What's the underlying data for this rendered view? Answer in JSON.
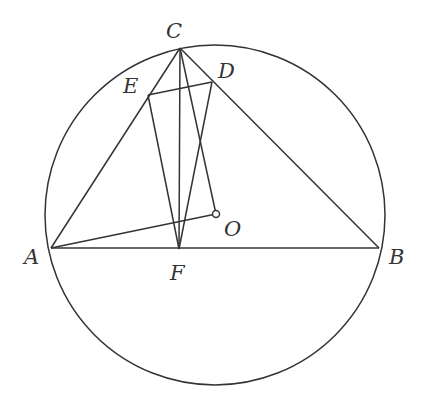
{
  "diagram": {
    "type": "geometry",
    "circle": {
      "center": "O",
      "cx": 215,
      "cy": 215,
      "r": 170
    },
    "points": [
      {
        "name": "A",
        "x": 51,
        "y": 248,
        "label_x": 24,
        "label_y": 264
      },
      {
        "name": "B",
        "x": 379,
        "y": 248,
        "label_x": 389,
        "label_y": 264
      },
      {
        "name": "C",
        "x": 180,
        "y": 48,
        "label_x": 166,
        "label_y": 38
      },
      {
        "name": "D",
        "x": 212,
        "y": 82,
        "label_x": 218,
        "label_y": 78
      },
      {
        "name": "E",
        "x": 148,
        "y": 95,
        "label_x": 123,
        "label_y": 93
      },
      {
        "name": "F",
        "x": 179,
        "y": 249,
        "label_x": 170,
        "label_y": 280
      },
      {
        "name": "O",
        "x": 216,
        "y": 214,
        "label_x": 224,
        "label_y": 236
      }
    ],
    "segments": [
      [
        "A",
        "B"
      ],
      [
        "A",
        "C"
      ],
      [
        "C",
        "B"
      ],
      [
        "A",
        "O"
      ],
      [
        "C",
        "O"
      ],
      [
        "C",
        "F"
      ],
      [
        "E",
        "F"
      ],
      [
        "D",
        "F"
      ],
      [
        "E",
        "D"
      ]
    ],
    "colors": {
      "stroke": "#333333",
      "background": "#ffffff"
    }
  }
}
